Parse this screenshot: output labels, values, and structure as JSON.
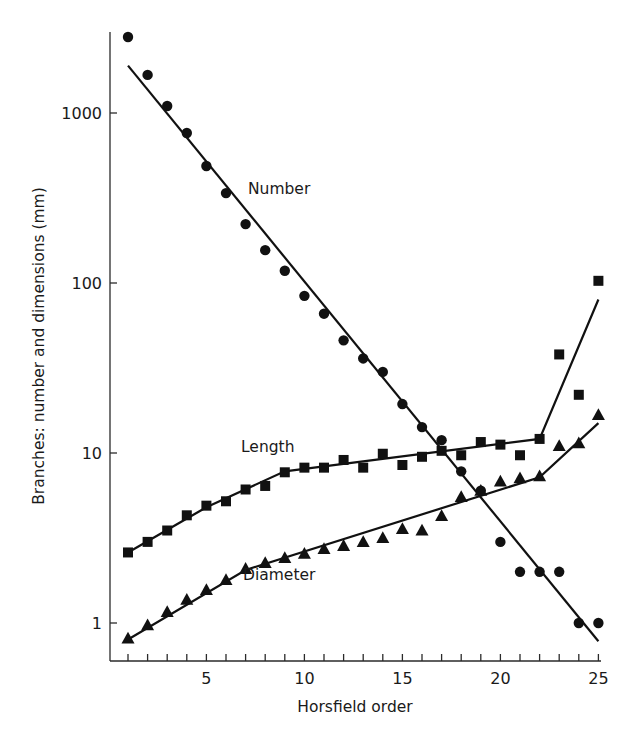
{
  "chart_data": {
    "type": "scatter",
    "title": "",
    "xlabel": "Horsfield order",
    "ylabel": "Branches: number and dimensions (mm)",
    "yscale": "log",
    "xlim": [
      0.5,
      25
    ],
    "ylim": [
      0.6,
      3500
    ],
    "grid": false,
    "legend": "inline labels",
    "x_ticks": [
      1,
      2,
      3,
      4,
      5,
      6,
      7,
      8,
      9,
      10,
      11,
      12,
      13,
      14,
      15,
      16,
      17,
      18,
      19,
      20,
      21,
      22,
      23,
      24,
      25
    ],
    "x_tick_labels": [
      {
        "value": 5,
        "label": "5"
      },
      {
        "value": 10,
        "label": "10"
      },
      {
        "value": 15,
        "label": "15"
      },
      {
        "value": 20,
        "label": "20"
      },
      {
        "value": 25,
        "label": "25"
      }
    ],
    "y_tick_labels": [
      {
        "value": 1,
        "label": "1"
      },
      {
        "value": 10,
        "label": "10"
      },
      {
        "value": 100,
        "label": "100"
      },
      {
        "value": 1000,
        "label": "1000"
      }
    ],
    "x": [
      1,
      2,
      3,
      4,
      5,
      6,
      7,
      8,
      9,
      10,
      11,
      12,
      13,
      14,
      15,
      16,
      17,
      18,
      19,
      20,
      21,
      22,
      23,
      24,
      25
    ],
    "series": [
      {
        "name": "Number",
        "marker": "circle",
        "label_pos": {
          "x": 248,
          "y": 194
        },
        "values": [
          2800,
          1675,
          1100,
          763,
          488,
          338,
          222,
          156,
          118,
          84,
          66,
          46,
          36,
          30,
          19.4,
          14.2,
          11.9,
          7.8,
          6.0,
          3.0,
          2.0,
          2.0,
          2.0,
          1.0,
          1.0
        ],
        "fit": [
          {
            "x": 1,
            "y": 1900
          },
          {
            "x": 25,
            "y": 0.78
          }
        ]
      },
      {
        "name": "Length",
        "marker": "square",
        "label_pos": {
          "x": 241,
          "y": 452
        },
        "values": [
          2.6,
          3.0,
          3.5,
          4.3,
          4.9,
          5.2,
          6.1,
          6.4,
          7.7,
          8.2,
          8.2,
          9.1,
          8.2,
          9.9,
          8.5,
          9.5,
          10.3,
          9.7,
          11.6,
          11.2,
          9.7,
          12.1,
          38,
          22,
          103
        ],
        "fit": [
          {
            "x": 1,
            "y": 2.6
          },
          {
            "x": 5,
            "y": 4.8
          },
          {
            "x": 9,
            "y": 7.8
          },
          {
            "x": 22,
            "y": 12.1
          },
          {
            "x": 25,
            "y": 80
          }
        ]
      },
      {
        "name": "Diameter",
        "marker": "triangle",
        "label_pos": {
          "x": 243,
          "y": 580
        },
        "values": [
          0.81,
          0.97,
          1.16,
          1.37,
          1.56,
          1.79,
          2.08,
          2.25,
          2.41,
          2.55,
          2.72,
          2.84,
          2.99,
          3.16,
          3.57,
          3.5,
          4.26,
          5.5,
          6.0,
          6.8,
          7.1,
          7.3,
          11,
          11.4,
          16.7
        ],
        "fit": [
          {
            "x": 1,
            "y": 0.8
          },
          {
            "x": 7,
            "y": 2.05
          },
          {
            "x": 22,
            "y": 7.2
          },
          {
            "x": 25,
            "y": 15
          }
        ]
      }
    ]
  }
}
